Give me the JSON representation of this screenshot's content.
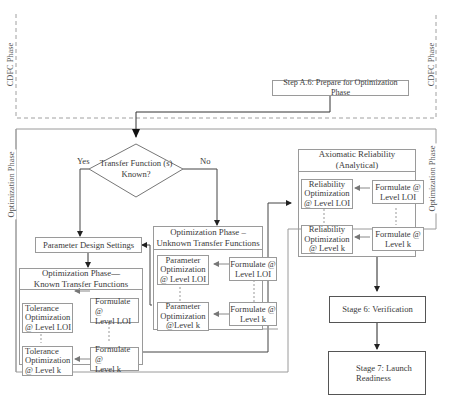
{
  "phases": {
    "cdfc_label": "CDFC Phase",
    "optimization_label": "Optimization Phase"
  },
  "step_a6": "Step A.6: Prepare for Optimization Phase",
  "decision": {
    "line1": "Transfer Function (s)",
    "line2": "Known?",
    "yes_label": "Yes",
    "no_label": "No"
  },
  "parameter_design": "Parameter Design Settings",
  "known_tf": {
    "title_line1": "Optimization Phase—",
    "title_line2": "Known Transfer Functions",
    "opt_top": [
      "Tolerance",
      "Optimization",
      "@ Level LOI"
    ],
    "form_top": [
      "Formulate @",
      "Level LOI"
    ],
    "opt_bottom": [
      "Tolerance",
      "Optimization",
      "@ Level k"
    ],
    "form_bottom": [
      "Formulate @",
      "Level k"
    ]
  },
  "unknown_tf": {
    "title_line1": "Optimization Phase –",
    "title_line2": "Unknown Transfer Functions",
    "opt_top": [
      "Parameter",
      "Optimization",
      "@ Level LOI"
    ],
    "form_top": [
      "Formulate @",
      "Level LOI"
    ],
    "opt_bottom": [
      "Parameter",
      "Optimization",
      "@Level k"
    ],
    "form_bottom": [
      "Formulate @",
      "Level k"
    ]
  },
  "axiomatic": {
    "title": "Axiomatic Reliability (Analytical)",
    "opt_top": [
      "Reliability",
      "Optimization",
      "@ Level LOI"
    ],
    "form_top": [
      "Formulate @",
      "Level LOI"
    ],
    "opt_bottom": [
      "Reliability",
      "Optimization",
      "@ Level k"
    ],
    "form_bottom": [
      "Formulate @",
      "Level k"
    ]
  },
  "stage6": "Stage 6: Verification",
  "stage7": [
    "Stage 7: Launch",
    "Readiness"
  ],
  "colors": {
    "line": "#8c8c8c",
    "arrow": "#222222",
    "dashed_frame": "#a0a0a0"
  }
}
